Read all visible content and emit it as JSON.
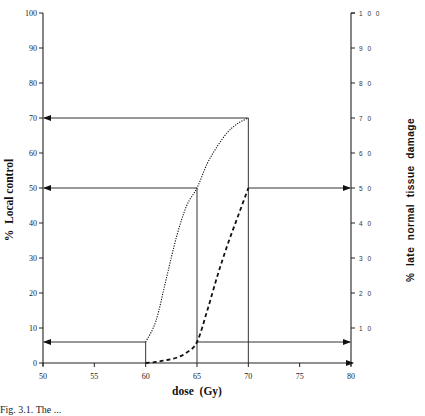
{
  "chart_data": {
    "type": "line",
    "title": "",
    "xlabel": "dose  (Gy)",
    "ylabel": "%  Local control",
    "ylabel_right": "%  late  normal  tissue  damage",
    "xlim": [
      50,
      80
    ],
    "ylim": [
      0,
      100
    ],
    "ylim_right": [
      0,
      100
    ],
    "x_ticks": [
      "50",
      "55",
      "60",
      "65",
      "70",
      "75",
      "80"
    ],
    "y_ticks_left": [
      "0",
      "10",
      "20",
      "30",
      "40",
      "50",
      "60",
      "70",
      "80",
      "90",
      "100"
    ],
    "y_ticks_right": [
      "10",
      "20",
      "30",
      "40",
      "50",
      "60",
      "70",
      "80",
      "90",
      "100"
    ],
    "grid": false,
    "legend": null,
    "series": [
      {
        "name": "Local control",
        "style": "dotted",
        "axis": "left",
        "x": [
          60,
          61,
          62,
          63,
          64,
          65,
          66,
          67,
          68,
          69,
          70
        ],
        "y": [
          6,
          12,
          24,
          36,
          45,
          50,
          57,
          62,
          66,
          68.5,
          70
        ]
      },
      {
        "name": "Late normal tissue damage",
        "style": "dashed",
        "axis": "right",
        "x": [
          60,
          61,
          62,
          63,
          64,
          65,
          66,
          67,
          68,
          69,
          70
        ],
        "y": [
          0,
          0.3,
          0.8,
          1.5,
          3,
          6,
          15,
          25,
          34,
          42,
          50
        ]
      }
    ],
    "annotations": {
      "guide_lines": [
        {
          "dose": 60,
          "local_control": 6,
          "tissue_damage": 0
        },
        {
          "dose": 65,
          "local_control": 50,
          "tissue_damage": 6
        },
        {
          "dose": 70,
          "local_control": 70,
          "tissue_damage": 50
        }
      ]
    }
  },
  "caption": "Fig. 3.1. The ..."
}
